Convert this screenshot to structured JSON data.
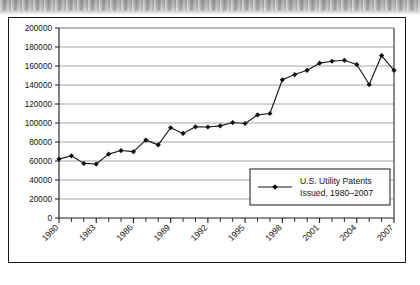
{
  "figure": {
    "background_color": "#ffffff",
    "frame_color": "#1a1a1a",
    "scan_band_color": "#a8a8a8"
  },
  "chart_data": {
    "type": "line",
    "title": "",
    "subtitle": "",
    "xlabel": "",
    "ylabel": "",
    "x": [
      1980,
      1981,
      1982,
      1983,
      1984,
      1985,
      1986,
      1987,
      1988,
      1989,
      1990,
      1991,
      1992,
      1993,
      1994,
      1995,
      1996,
      1997,
      1998,
      1999,
      2000,
      2001,
      2002,
      2003,
      2004,
      2005,
      2006,
      2007
    ],
    "values": [
      62000,
      65500,
      57500,
      56800,
      67200,
      71000,
      69800,
      82000,
      77000,
      95000,
      89000,
      96000,
      95800,
      97000,
      100500,
      99500,
      108500,
      110000,
      145500,
      151000,
      155500,
      163000,
      165000,
      166000,
      161500,
      140500,
      171000,
      155500
    ],
    "series": [
      {
        "name": "U.S. Utility Patents Issued, 1980–2007",
        "values": [
          62000,
          65500,
          57500,
          56800,
          67200,
          71000,
          69800,
          82000,
          77000,
          95000,
          89000,
          96000,
          95800,
          97000,
          100500,
          99500,
          108500,
          110000,
          145500,
          151000,
          155500,
          163000,
          165000,
          166000,
          161500,
          140500,
          171000,
          155500
        ]
      }
    ],
    "xlim": [
      1980,
      2007
    ],
    "ylim": [
      0,
      200000
    ],
    "ytick_values": [
      0,
      20000,
      40000,
      60000,
      80000,
      100000,
      120000,
      140000,
      160000,
      180000,
      200000
    ],
    "ytick_labels": [
      "0",
      "20000",
      "40000",
      "60000",
      "80000",
      "100000",
      "120000",
      "140000",
      "160000",
      "180000",
      "200000"
    ],
    "xtick_values": [
      1980,
      1983,
      1986,
      1989,
      1992,
      1995,
      1998,
      2001,
      2004,
      2007
    ],
    "xtick_labels": [
      "1980",
      "1983",
      "1986",
      "1989",
      "1992",
      "1995",
      "1998",
      "2001",
      "2004",
      "2007"
    ],
    "xtick_minor_every": 1,
    "xtick_label_rotation": -45,
    "grid": {
      "horizontal": true,
      "vertical": false,
      "color": "#9a9a9a"
    },
    "line_color": "#1a1a1a",
    "marker": "diamond",
    "marker_color": "#111111",
    "legend": {
      "position": "lower-right-inside",
      "entries": [
        {
          "label_line1": "U.S. Utility Patents",
          "label_line2": "Issued, 1980–2007",
          "marker": "diamond",
          "line_color": "#1a1a1a"
        }
      ],
      "border_color": "#1a1a1a",
      "background_color": "#ffffff"
    }
  }
}
